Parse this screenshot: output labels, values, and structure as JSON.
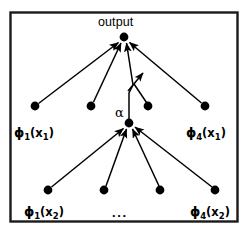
{
  "figure": {
    "border_color": "#1a1a1a",
    "background": "#ffffff",
    "ink_color": "#000000",
    "output_label": "output",
    "alpha_label": "α",
    "ellipsis": "...",
    "nodes": {
      "output": {
        "x": 124,
        "y": 37,
        "r": 4.4
      },
      "hub": {
        "x": 129,
        "y": 123,
        "r": 4.4
      },
      "tier1": [
        {
          "x": 35,
          "y": 106,
          "r": 4.4
        },
        {
          "x": 91,
          "y": 106,
          "r": 4.4
        },
        {
          "x": 148,
          "y": 106,
          "r": 4.4
        },
        {
          "x": 205,
          "y": 106,
          "r": 4.4
        }
      ],
      "tier2": [
        {
          "x": 48,
          "y": 190,
          "r": 4.4
        },
        {
          "x": 104,
          "y": 190,
          "r": 4.4
        },
        {
          "x": 160,
          "y": 190,
          "r": 4.4
        },
        {
          "x": 215,
          "y": 190,
          "r": 4.4
        }
      ]
    },
    "tier1_labels": [
      {
        "phi": "ϕ",
        "sub": "1",
        "arg": "(x",
        "argsub": "1",
        "close": ")",
        "x": 14,
        "y": 126
      },
      {
        "phi": "ϕ",
        "sub": "4",
        "arg": "(x",
        "argsub": "1",
        "close": ")",
        "x": 186,
        "y": 126
      }
    ],
    "tier2_labels": [
      {
        "phi": "ϕ",
        "sub": "1",
        "arg": "(x",
        "argsub": "2",
        "close": ")",
        "x": 24,
        "y": 205
      },
      {
        "phi": "ϕ",
        "sub": "4",
        "arg": "(x",
        "argsub": "2",
        "close": ")",
        "x": 190,
        "y": 205
      }
    ],
    "output_label_pos": {
      "x": 98,
      "y": 16
    },
    "alpha_label_pos": {
      "x": 115,
      "y": 107
    },
    "ellipsis_pos": {
      "x": 112,
      "y": 206
    },
    "annotation_arrow": {
      "from": {
        "x": 129,
        "y": 92
      },
      "to": {
        "x": 143,
        "y": 74
      }
    }
  }
}
